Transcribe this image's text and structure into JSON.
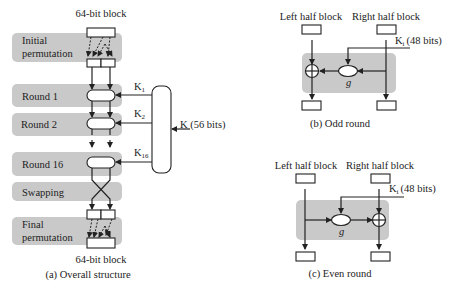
{
  "overall": {
    "top_label": "64-bit block",
    "bottom_label": "64-bit block",
    "caption": "(a)  Overall structure",
    "stages": [
      {
        "line1": "Initial",
        "line2": "permutation"
      },
      {
        "line1": "Round 1"
      },
      {
        "line1": "Round 2"
      },
      {
        "line1": "Round 16"
      },
      {
        "line1": "Swapping"
      },
      {
        "line1": "Final",
        "line2": "permutation"
      }
    ],
    "keys": {
      "k1": "K",
      "k1_sub": "1",
      "k2": "K",
      "k2_sub": "2",
      "k16": "K",
      "k16_sub": "16",
      "master": "K (56 bits)"
    }
  },
  "odd_round": {
    "left_label": "Left half block",
    "right_label": "Right half block",
    "key_label": "K",
    "key_sub": "i",
    "key_bits": "(48 bits)",
    "function_label": "g",
    "caption": "(b)  Odd round"
  },
  "even_round": {
    "left_label": "Left half block",
    "right_label": "Right half block",
    "key_label": "K",
    "key_sub": "i",
    "key_bits": "(48 bits)",
    "function_label": "g",
    "caption": "(c)  Even round"
  },
  "colors": {
    "band": "#c9c9c9",
    "stroke": "#222222"
  }
}
